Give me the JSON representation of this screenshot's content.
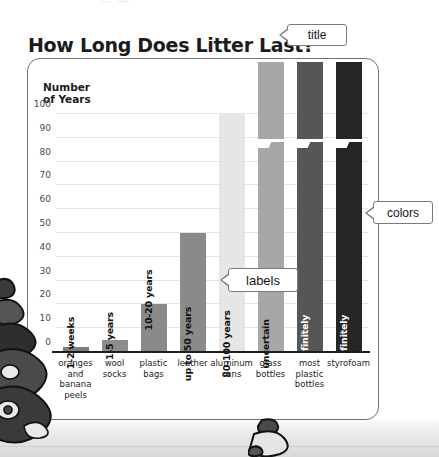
{
  "page": {
    "top_clipped_text": "— —",
    "title": "How Long Does Litter Last?"
  },
  "callouts": {
    "title": "title",
    "labels": "labels",
    "colors": "colors"
  },
  "chart_data": {
    "type": "bar",
    "title": "How Long Does Litter Last?",
    "xlabel": "",
    "ylabel": "Number of Years",
    "ylim": [
      0,
      100
    ],
    "yticks": [
      0,
      10,
      20,
      30,
      40,
      50,
      60,
      70,
      80,
      90,
      100
    ],
    "grid": true,
    "legend": "none",
    "axis_break": "Bars for glass bottles, most plastic bottles and styrofoam are broken to show values beyond the 100-year axis.",
    "categories": [
      "oranges and banana peels",
      "wool socks",
      "plastic bags",
      "leather",
      "aluminum cans",
      "glass bottles",
      "most plastic bottles",
      "styrofoam"
    ],
    "values": [
      2,
      5,
      20,
      50,
      100,
      115,
      115,
      115
    ],
    "bar_labels": [
      "1-2 weeks",
      "1-5 years",
      "10-20 years",
      "up to 50 years",
      "80-100 years",
      "uncertain",
      "indefinitely",
      "indefinitely"
    ],
    "bar_colors": [
      "#7c7c7c",
      "#8d8d8d",
      "#8a8a8a",
      "#8a8a8a",
      "#e6e6e6",
      "#a7a7a7",
      "#565656",
      "#262626"
    ],
    "axis_color": "#1d1d1d",
    "grid_color": "#e3e3e3"
  }
}
